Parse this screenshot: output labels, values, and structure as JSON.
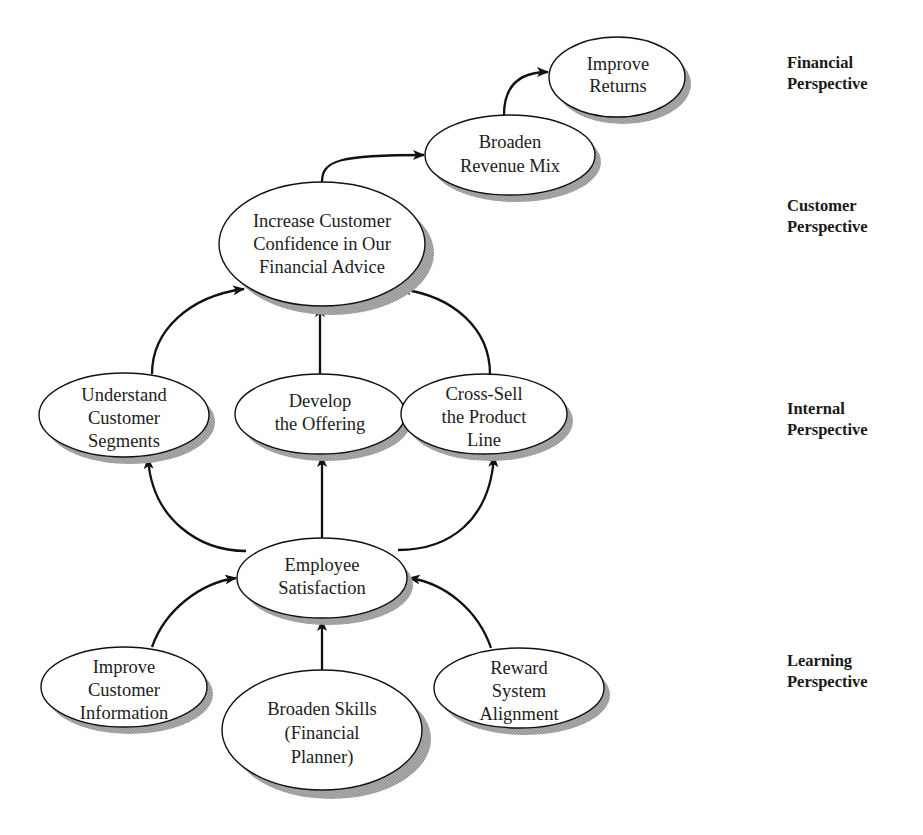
{
  "diagram": {
    "perspectives": [
      {
        "id": "financial",
        "line1": "Financial",
        "line2": "Perspective"
      },
      {
        "id": "customer",
        "line1": "Customer",
        "line2": "Perspective"
      },
      {
        "id": "internal",
        "line1": "Internal",
        "line2": "Perspective"
      },
      {
        "id": "learning",
        "line1": "Learning",
        "line2": "Perspective"
      }
    ],
    "nodes": {
      "improve_returns": {
        "lines": [
          "Improve",
          "Returns"
        ],
        "perspective": "financial"
      },
      "broaden_revenue_mix": {
        "lines": [
          "Broaden",
          "Revenue Mix"
        ],
        "perspective": "financial"
      },
      "increase_customer_confidence": {
        "lines": [
          "Increase Customer",
          "Confidence in Our",
          "Financial Advice"
        ],
        "perspective": "customer"
      },
      "understand_customer_segments": {
        "lines": [
          "Understand",
          "Customer",
          "Segments"
        ],
        "perspective": "internal"
      },
      "develop_the_offering": {
        "lines": [
          "Develop",
          "the Offering"
        ],
        "perspective": "internal"
      },
      "cross_sell_product_line": {
        "lines": [
          "Cross-Sell",
          "the Product",
          "Line"
        ],
        "perspective": "internal"
      },
      "employee_satisfaction": {
        "lines": [
          "Employee",
          "Satisfaction"
        ],
        "perspective": "learning"
      },
      "improve_customer_information": {
        "lines": [
          "Improve",
          "Customer",
          "Information"
        ],
        "perspective": "learning"
      },
      "broaden_skills": {
        "lines": [
          "Broaden Skills",
          "(Financial",
          "Planner)"
        ],
        "perspective": "learning"
      },
      "reward_system_alignment": {
        "lines": [
          "Reward",
          "System",
          "Alignment"
        ],
        "perspective": "learning"
      }
    },
    "edges": [
      {
        "from": "broaden_revenue_mix",
        "to": "improve_returns"
      },
      {
        "from": "increase_customer_confidence",
        "to": "broaden_revenue_mix"
      },
      {
        "from": "understand_customer_segments",
        "to": "increase_customer_confidence"
      },
      {
        "from": "develop_the_offering",
        "to": "increase_customer_confidence"
      },
      {
        "from": "cross_sell_product_line",
        "to": "increase_customer_confidence"
      },
      {
        "from": "employee_satisfaction",
        "to": "understand_customer_segments"
      },
      {
        "from": "employee_satisfaction",
        "to": "develop_the_offering"
      },
      {
        "from": "employee_satisfaction",
        "to": "cross_sell_product_line"
      },
      {
        "from": "improve_customer_information",
        "to": "employee_satisfaction"
      },
      {
        "from": "broaden_skills",
        "to": "employee_satisfaction"
      },
      {
        "from": "reward_system_alignment",
        "to": "employee_satisfaction"
      }
    ]
  }
}
